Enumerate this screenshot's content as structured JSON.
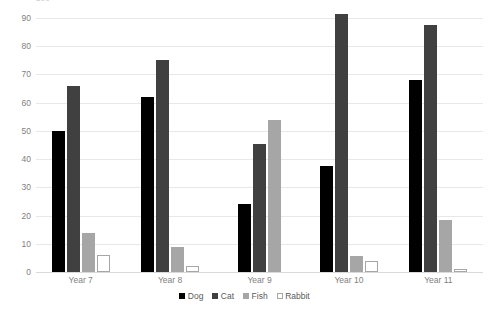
{
  "chart_data": {
    "type": "bar",
    "title": "",
    "subtitle": "",
    "xlabel": "",
    "ylabel": "",
    "categories": [
      "Year 7",
      "Year 8",
      "Year 9",
      "Year 10",
      "Year 11"
    ],
    "series": [
      {
        "name": "Dog",
        "color": "#000000",
        "values": [
          50,
          62,
          24,
          37.5,
          68
        ]
      },
      {
        "name": "Cat",
        "color": "#404040",
        "values": [
          66,
          75,
          45.5,
          91.5,
          87.5
        ]
      },
      {
        "name": "Fish",
        "color": "#a6a6a6",
        "values": [
          14,
          9,
          54,
          5.5,
          18.5
        ]
      },
      {
        "name": "Rabbit",
        "color": "#ffffff",
        "values": [
          6,
          2,
          0,
          4,
          1
        ]
      }
    ],
    "ylim": [
      0,
      90
    ],
    "yticks": [
      0,
      10,
      20,
      30,
      40,
      50,
      60,
      70,
      80,
      90
    ],
    "ytick_labels": [
      "0",
      "10",
      "20",
      "30",
      "40",
      "50",
      "60",
      "70",
      "80",
      "90"
    ],
    "grid": true,
    "grid_color": "#e8e8e8",
    "legend_position": "bottom",
    "legend_entries": [
      "Dog",
      "Cat",
      "Fish",
      "Rabbit"
    ],
    "axis_label_color": "#7f7f7f",
    "background": "#ffffff",
    "top_clipped_tick_label": "100"
  }
}
